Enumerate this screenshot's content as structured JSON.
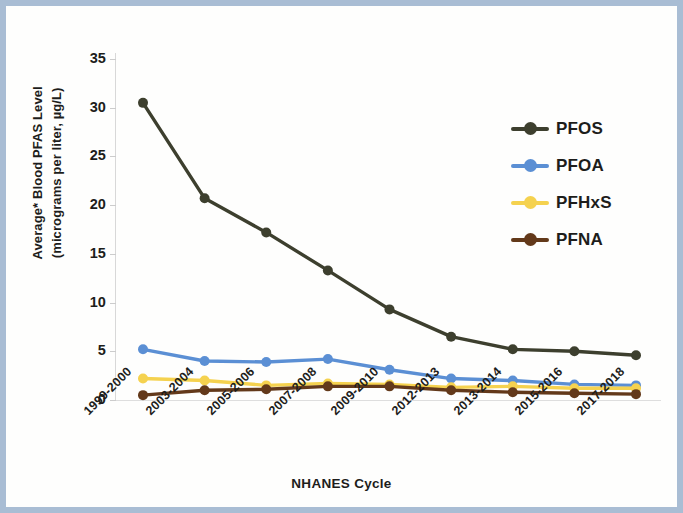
{
  "figure": {
    "border_color": "#a9bdd4",
    "background": "#fefefd"
  },
  "chart_data": {
    "type": "line",
    "title": "",
    "xlabel": "NHANES Cycle",
    "ylabel": "Average* Blood PFAS Level (micrograms per liter, µg/L)",
    "ylabel_line1": "Average* Blood PFAS Level",
    "ylabel_line2": "(micrograms per liter, µg/L)",
    "categories": [
      "1999-2000",
      "2003-2004",
      "2005-2006",
      "2007-2008",
      "2009-2010",
      "2012-2013",
      "2013-2014",
      "2015-2016",
      "2017-2018"
    ],
    "ylim": [
      0,
      35
    ],
    "yticks": [
      0,
      5,
      10,
      15,
      20,
      25,
      30,
      35
    ],
    "ytick_labels": [
      "0",
      "5",
      "10",
      "15",
      "20",
      "25",
      "30",
      "35"
    ],
    "grid": false,
    "legend_position": "right",
    "series": [
      {
        "name": "PFOS",
        "color": "#3d3f2e",
        "values": [
          30.5,
          20.7,
          17.2,
          13.3,
          9.3,
          6.5,
          5.2,
          5.0,
          4.6
        ]
      },
      {
        "name": "PFOA",
        "color": "#5b8fd4",
        "values": [
          5.2,
          4.0,
          3.9,
          4.2,
          3.1,
          2.2,
          2.0,
          1.6,
          1.5
        ]
      },
      {
        "name": "PFHxS",
        "color": "#f5d24f",
        "values": [
          2.2,
          2.0,
          1.5,
          1.7,
          1.6,
          1.3,
          1.4,
          1.2,
          1.2
        ]
      },
      {
        "name": "PFNA",
        "color": "#63391a",
        "values": [
          0.5,
          1.0,
          1.1,
          1.4,
          1.4,
          1.0,
          0.8,
          0.7,
          0.6
        ]
      }
    ]
  }
}
